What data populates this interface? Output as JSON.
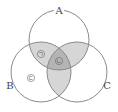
{
  "diagram": {
    "type": "venn",
    "sets": [
      {
        "name": "A",
        "cx": 59,
        "cy": 40,
        "r": 30
      },
      {
        "name": "B",
        "cx": 41,
        "cy": 72,
        "r": 30
      },
      {
        "name": "C",
        "cx": 77,
        "cy": 72,
        "r": 30
      }
    ],
    "labels": {
      "a": "A",
      "b": "B",
      "c": "C"
    },
    "region_marks": {
      "ab_only": "ㄱ",
      "abc": "ㄴ",
      "b_only": "ㄷ"
    },
    "colors": {
      "stroke": "#8a8a8a",
      "pair_fill": "#d6d6d6",
      "triple_fill": "#b4b4b4",
      "background": "#ffffff"
    }
  }
}
